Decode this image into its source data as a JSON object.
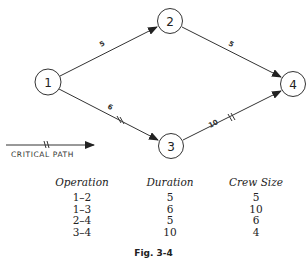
{
  "diagram": {
    "nodes": [
      {
        "id": "1",
        "label": "1",
        "cx": 48,
        "cy": 82
      },
      {
        "id": "2",
        "label": "2",
        "cx": 170,
        "cy": 21
      },
      {
        "id": "3",
        "label": "3",
        "cx": 171,
        "cy": 146
      },
      {
        "id": "4",
        "label": "4",
        "cx": 293,
        "cy": 84
      }
    ],
    "edges": [
      {
        "from": "1",
        "to": "2",
        "label": "5",
        "critical": false
      },
      {
        "from": "1",
        "to": "3",
        "label": "6",
        "critical": true
      },
      {
        "from": "2",
        "to": "4",
        "label": "5",
        "critical": false
      },
      {
        "from": "3",
        "to": "4",
        "label": "10",
        "critical": true
      }
    ],
    "legend": {
      "label": "CRITICAL PATH"
    }
  },
  "table": {
    "headers": [
      "Operation",
      "Duration",
      "Crew Size"
    ],
    "rows": [
      [
        "1–2",
        "5",
        "5"
      ],
      [
        "1–3",
        "6",
        "10"
      ],
      [
        "2–4",
        "5",
        "6"
      ],
      [
        "3–4",
        "10",
        "4"
      ]
    ]
  },
  "caption": "Fig. 3-4"
}
